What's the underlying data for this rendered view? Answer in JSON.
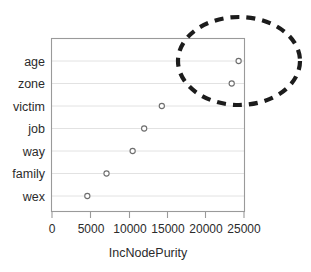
{
  "chart_data": {
    "type": "scatter",
    "title": "",
    "subtitle": "",
    "xlabel": "IncNodePurity",
    "ylabel": "",
    "categories": [
      "age",
      "zone",
      "victim",
      "job",
      "way",
      "family",
      "wex"
    ],
    "values": [
      24300,
      23400,
      14300,
      12000,
      10500,
      7100,
      4600
    ],
    "x_ticks": [
      0,
      5000,
      10000,
      15000,
      20000,
      25000
    ],
    "x_tick_labels": [
      "0",
      "5000",
      "10000",
      "15000",
      "20000",
      "25000"
    ],
    "xlim": [
      0,
      25000
    ],
    "grid": "horizontal",
    "legend": "none",
    "marker": "open-circle",
    "annotations": [
      {
        "name": "highlight-ellipse",
        "shape": "dashed-ellipse",
        "encloses": [
          "age",
          "zone"
        ],
        "color": "#1c1c1c"
      }
    ]
  },
  "plot": {
    "frame_color": "#9a9a9a",
    "grid_color": "#e2e2e2",
    "marker_stroke": "#6e6e6e",
    "text_color": "#2b2b2b",
    "background": "#ffffff"
  }
}
